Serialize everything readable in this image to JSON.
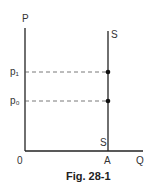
{
  "diagram": {
    "type": "supply-fixed-quantity",
    "axes": {
      "y_label": "P",
      "x_label": "Q",
      "origin_label": "0"
    },
    "supply_curve": {
      "label_top": "S",
      "label_bottom": "S",
      "quantity_label": "A"
    },
    "price_levels": [
      {
        "label": "p₁",
        "y": 72
      },
      {
        "label": "p₀",
        "y": 101
      }
    ],
    "caption": "Fig. 28-1"
  }
}
